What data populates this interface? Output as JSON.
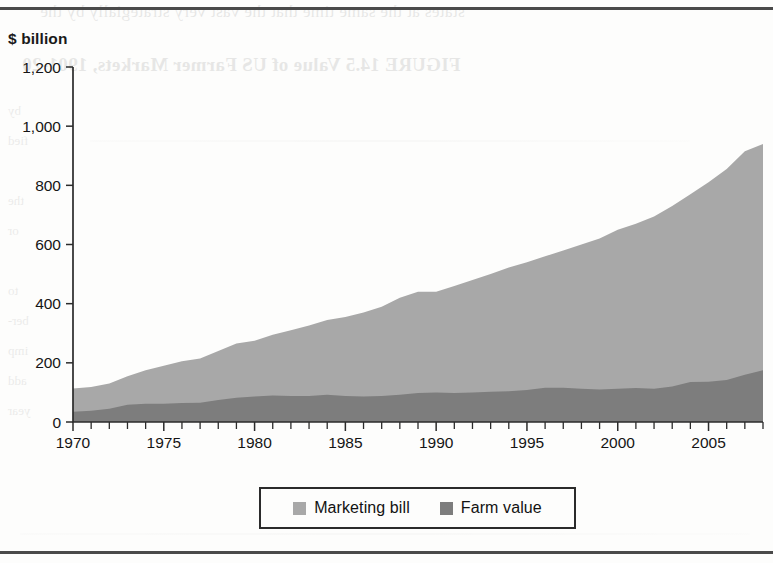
{
  "figure": {
    "unit_label": "$ billion"
  },
  "legend": {
    "entries": [
      {
        "label": "Marketing bill",
        "color": "#a8a8a8",
        "swatch_name": "marketing-bill-swatch"
      },
      {
        "label": "Farm value",
        "color": "#7d7d7d",
        "swatch_name": "farm-value-swatch"
      }
    ]
  },
  "bleed_through": {
    "line_top": "states at the same time that the vast very strategially by the",
    "line_title": "FIGURE 14.5  Value of US Farmer Markets, 1901-20",
    "column": "by\nfied\n\nthe\nor\n\nto\nber-\nimp\nadd\nyear"
  },
  "chart_data": {
    "type": "area",
    "stacked": true,
    "title": "",
    "subtitle": "",
    "xlabel": "",
    "ylabel": "$ billion",
    "ylim": [
      0,
      1200
    ],
    "xlim": [
      1970,
      2008
    ],
    "yticks": [
      0,
      200,
      400,
      600,
      800,
      1000,
      1200
    ],
    "ytick_labels": [
      "0",
      "200",
      "400",
      "600",
      "800",
      "1,000",
      "1,200"
    ],
    "xticks": [
      1970,
      1975,
      1980,
      1985,
      1990,
      1995,
      2000,
      2005
    ],
    "xtick_labels": [
      "1970",
      "1975",
      "1980",
      "1985",
      "1990",
      "1995",
      "2000",
      "2005"
    ],
    "x_minor_tick_step": 1,
    "grid": false,
    "legend_position": "bottom-center",
    "x": [
      1970,
      1971,
      1972,
      1973,
      1974,
      1975,
      1976,
      1977,
      1978,
      1979,
      1980,
      1981,
      1982,
      1983,
      1984,
      1985,
      1986,
      1987,
      1988,
      1989,
      1990,
      1991,
      1992,
      1993,
      1994,
      1995,
      1996,
      1997,
      1998,
      1999,
      2000,
      2001,
      2002,
      2003,
      2004,
      2005,
      2006,
      2007,
      2008
    ],
    "series": [
      {
        "name": "Farm value",
        "color": "#7d7d7d",
        "stack_order": 1,
        "values": [
          35,
          38,
          45,
          58,
          62,
          62,
          64,
          65,
          74,
          82,
          86,
          90,
          88,
          88,
          92,
          88,
          86,
          88,
          92,
          98,
          100,
          98,
          100,
          102,
          104,
          108,
          116,
          116,
          112,
          110,
          112,
          115,
          112,
          120,
          135,
          136,
          142,
          160,
          175
        ]
      },
      {
        "name": "Marketing bill",
        "color": "#a8a8a8",
        "stack_order": 2,
        "values": [
          78,
          80,
          85,
          97,
          113,
          128,
          141,
          150,
          166,
          183,
          189,
          205,
          222,
          238,
          253,
          267,
          284,
          302,
          328,
          342,
          340,
          362,
          380,
          398,
          418,
          432,
          444,
          464,
          488,
          510,
          538,
          555,
          583,
          610,
          635,
          674,
          713,
          755,
          765
        ]
      }
    ],
    "totals": [
      113,
      118,
      130,
      155,
      175,
      190,
      205,
      215,
      240,
      265,
      275,
      295,
      310,
      326,
      345,
      355,
      370,
      390,
      420,
      440,
      440,
      460,
      480,
      500,
      522,
      540,
      560,
      580,
      600,
      620,
      650,
      670,
      695,
      730,
      770,
      810,
      855,
      915,
      940
    ]
  }
}
